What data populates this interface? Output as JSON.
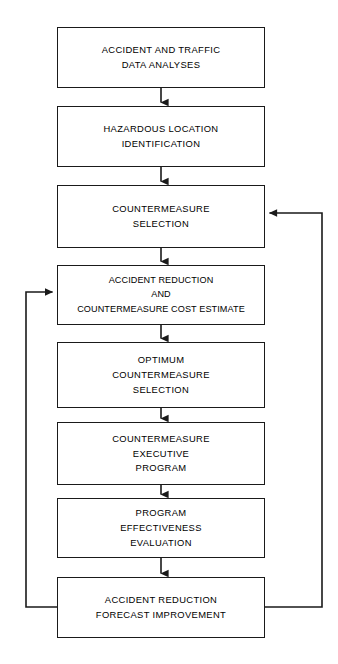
{
  "diagram": {
    "type": "flowchart",
    "orientation": "vertical top-to-bottom with two feedback loops",
    "colors": {
      "background": "#ffffff",
      "stroke": "#1a1a1a",
      "text": "#000000"
    },
    "nodes": [
      {
        "id": "n1",
        "lines": [
          "ACCIDENT AND TRAFFIC",
          "DATA ANALYSES"
        ],
        "x": 57,
        "y": 27,
        "w": 208,
        "h": 61
      },
      {
        "id": "n2",
        "lines": [
          "HAZARDOUS LOCATION",
          "IDENTIFICATION"
        ],
        "x": 57,
        "y": 106,
        "w": 208,
        "h": 61
      },
      {
        "id": "n3",
        "lines": [
          "COUNTERMEASURE",
          "SELECTION"
        ],
        "x": 57,
        "y": 185,
        "w": 208,
        "h": 63
      },
      {
        "id": "n4",
        "lines": [
          "ACCIDENT REDUCTION",
          "AND",
          "COUNTERMEASURE COST ESTIMATE"
        ],
        "x": 57,
        "y": 265,
        "w": 208,
        "h": 60
      },
      {
        "id": "n5",
        "lines": [
          "OPTIMUM",
          "COUNTERMEASURE",
          "SELECTION"
        ],
        "x": 57,
        "y": 342,
        "w": 208,
        "h": 66
      },
      {
        "id": "n6",
        "lines": [
          "COUNTERMEASURE",
          "EXECUTIVE",
          "PROGRAM"
        ],
        "x": 57,
        "y": 422,
        "w": 208,
        "h": 63
      },
      {
        "id": "n7",
        "lines": [
          "PROGRAM",
          "EFFECTIVENESS",
          "EVALUATION"
        ],
        "x": 57,
        "y": 498,
        "w": 208,
        "h": 60
      },
      {
        "id": "n8",
        "lines": [
          "ACCIDENT REDUCTION",
          "FORECAST IMPROVEMENT"
        ],
        "x": 57,
        "y": 577,
        "w": 208,
        "h": 61
      }
    ],
    "connectors": [
      {
        "id": "c1",
        "from": "n1",
        "to": "n2",
        "kind": "down-arrow"
      },
      {
        "id": "c2",
        "from": "n2",
        "to": "n3",
        "kind": "down-arrow"
      },
      {
        "id": "c3",
        "from": "n3",
        "to": "n4",
        "kind": "down-arrow"
      },
      {
        "id": "c4",
        "from": "n4",
        "to": "n5",
        "kind": "down-arrow"
      },
      {
        "id": "c5",
        "from": "n5",
        "to": "n6",
        "kind": "down-arrow"
      },
      {
        "id": "c6",
        "from": "n6",
        "to": "n7",
        "kind": "down-arrow"
      },
      {
        "id": "c7",
        "from": "n7",
        "to": "n8",
        "kind": "down-arrow"
      },
      {
        "id": "c8",
        "from": "n8",
        "to": "n4",
        "kind": "feedback-left"
      },
      {
        "id": "c9",
        "from": "n8",
        "to": "n3",
        "kind": "feedback-right"
      }
    ]
  }
}
